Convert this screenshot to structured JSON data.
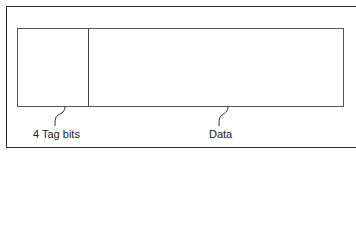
{
  "diagram": {
    "fields": [
      {
        "id": "tag",
        "label": "4 Tag bits"
      },
      {
        "id": "data",
        "label": "Data"
      }
    ],
    "colors": {
      "stroke": "#444444",
      "text": "#222222",
      "background": "#ffffff"
    }
  }
}
